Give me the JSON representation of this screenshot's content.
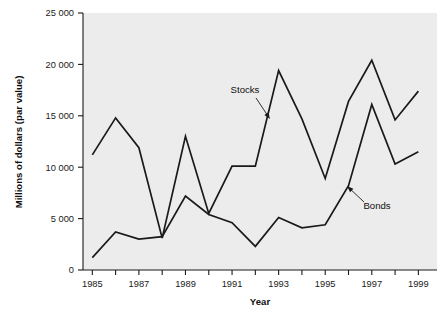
{
  "chart_data": {
    "type": "line",
    "title": "",
    "xlabel": "Year",
    "ylabel": "Millions of dollars (par value)",
    "x": [
      1985,
      1986,
      1987,
      1988,
      1989,
      1990,
      1991,
      1992,
      1993,
      1994,
      1995,
      1996,
      1997,
      1998,
      1999
    ],
    "xlim": [
      1984.6,
      1999.8
    ],
    "ylim": [
      0,
      25000
    ],
    "xticks": [
      1985,
      1986,
      1987,
      1988,
      1989,
      1990,
      1991,
      1992,
      1993,
      1994,
      1995,
      1996,
      1997,
      1998,
      1999
    ],
    "xtick_labels": [
      "1985",
      "",
      "1987",
      "",
      "1989",
      "",
      "1991",
      "",
      "1993",
      "",
      "1995",
      "",
      "1997",
      "",
      "1999"
    ],
    "yticks": [
      0,
      5000,
      10000,
      15000,
      20000,
      25000
    ],
    "ytick_labels": [
      "0",
      "5 000",
      "10 000",
      "15 000",
      "20 000",
      "25 000"
    ],
    "grid": false,
    "legend_position": "inline-annotations",
    "plot_background": "#ececec",
    "line_color": "#1a1a1a",
    "series": [
      {
        "name": "Stocks",
        "values": [
          11200,
          14800,
          11900,
          3100,
          13000,
          5500,
          10100,
          10100,
          19400,
          14700,
          8900,
          16400,
          20400,
          14600,
          17400
        ]
      },
      {
        "name": "Bonds",
        "values": [
          1200,
          3700,
          3000,
          3250,
          7200,
          5400,
          4600,
          2300,
          5100,
          4100,
          4400,
          8200,
          16100,
          10300,
          11500
        ]
      }
    ],
    "annotations": [
      {
        "label": "Stocks",
        "label_x": 245,
        "label_y": 93,
        "arrow_from_x": 256,
        "arrow_from_y": 98,
        "arrow_to_x": 270,
        "arrow_to_y": 119
      },
      {
        "label": "Bonds",
        "label_x": 377,
        "label_y": 209,
        "arrow_from_x": 364,
        "arrow_from_y": 202,
        "arrow_to_x": 347,
        "arrow_to_y": 186
      }
    ]
  }
}
